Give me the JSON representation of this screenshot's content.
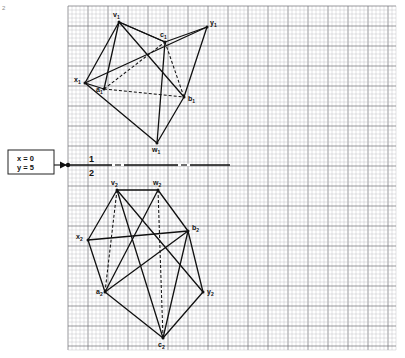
{
  "page": {
    "corner_mark": "2",
    "background_color": "#ffffff",
    "grid": {
      "minor_color": "#b9b9bc",
      "major_color": "#6e6e74",
      "minor_step": 4.0,
      "major_every": 5,
      "x0": 68,
      "y0": 6,
      "x1": 396,
      "y1": 350
    }
  },
  "callout": {
    "line1": "x = 0",
    "line2": "y = 5",
    "box": {
      "x": 8,
      "y": 150,
      "w": 46,
      "h": 24
    },
    "arrow_from_x": 54,
    "arrow_to_x": 68,
    "arrow_y": 165,
    "border_color": "#222222",
    "fill_color": "#ffffff"
  },
  "axis": {
    "label_top": "1",
    "label_bottom": "2",
    "y": 165,
    "x_start": 68,
    "x_end": 230,
    "color": "#111111",
    "dot_x": 68,
    "dash_segments": [
      {
        "x": 112,
        "w": 12
      },
      {
        "x": 178,
        "w": 12
      }
    ]
  },
  "figures": {
    "top": {
      "name": "view-1",
      "vertices": {
        "v1": {
          "x": 119,
          "y": 22,
          "label": "v",
          "sub": "1",
          "lx": 113,
          "ly": 17
        },
        "y1": {
          "x": 207,
          "y": 27,
          "label": "y",
          "sub": "1",
          "lx": 210,
          "ly": 25
        },
        "c1": {
          "x": 165,
          "y": 42,
          "label": "c",
          "sub": "1",
          "lx": 160,
          "ly": 37
        },
        "x1": {
          "x": 85,
          "y": 83,
          "label": "x",
          "sub": "1",
          "lx": 74,
          "ly": 82
        },
        "a1": {
          "x": 104,
          "y": 89,
          "label": "a",
          "sub": "1",
          "lx": 96,
          "ly": 92
        },
        "b1": {
          "x": 184,
          "y": 97,
          "label": "b",
          "sub": "1",
          "lx": 188,
          "ly": 101
        },
        "w1": {
          "x": 157,
          "y": 143,
          "label": "w",
          "sub": "1",
          "lx": 152,
          "ly": 152
        }
      },
      "solid_edges": [
        [
          "v1",
          "x1"
        ],
        [
          "x1",
          "w1"
        ],
        [
          "w1",
          "b1"
        ],
        [
          "b1",
          "y1"
        ],
        [
          "y1",
          "c1"
        ],
        [
          "c1",
          "v1"
        ],
        [
          "v1",
          "b1"
        ],
        [
          "v1",
          "c1"
        ],
        [
          "x1",
          "y1"
        ],
        [
          "c1",
          "w1"
        ],
        [
          "a1",
          "v1"
        ],
        [
          "a1",
          "x1"
        ]
      ],
      "dashed_edges": [
        [
          "a1",
          "c1"
        ],
        [
          "a1",
          "b1"
        ],
        [
          "c1",
          "b1"
        ]
      ]
    },
    "bottom": {
      "name": "view-2",
      "vertices": {
        "v2": {
          "x": 117,
          "y": 190,
          "label": "v",
          "sub": "2",
          "lx": 111,
          "ly": 185
        },
        "w2": {
          "x": 158,
          "y": 190,
          "label": "w",
          "sub": "2",
          "lx": 153,
          "ly": 185
        },
        "b2": {
          "x": 188,
          "y": 231,
          "label": "b",
          "sub": "2",
          "lx": 192,
          "ly": 230
        },
        "x2": {
          "x": 88,
          "y": 240,
          "label": "x",
          "sub": "2",
          "lx": 76,
          "ly": 239
        },
        "a2": {
          "x": 105,
          "y": 292,
          "label": "a",
          "sub": "2",
          "lx": 96,
          "ly": 294
        },
        "y2": {
          "x": 203,
          "y": 292,
          "label": "y",
          "sub": "2",
          "lx": 207,
          "ly": 294
        },
        "c2": {
          "x": 163,
          "y": 338,
          "label": "c",
          "sub": "2",
          "lx": 158,
          "ly": 347
        }
      },
      "solid_edges": [
        [
          "v2",
          "x2"
        ],
        [
          "x2",
          "a2"
        ],
        [
          "a2",
          "c2"
        ],
        [
          "c2",
          "y2"
        ],
        [
          "y2",
          "b2"
        ],
        [
          "b2",
          "w2"
        ],
        [
          "w2",
          "v2"
        ],
        [
          "v2",
          "y2"
        ],
        [
          "x2",
          "b2"
        ],
        [
          "a2",
          "b2"
        ],
        [
          "w2",
          "a2"
        ],
        [
          "v2",
          "c2"
        ],
        [
          "b2",
          "c2"
        ]
      ],
      "dashed_edges": [
        [
          "v2",
          "a2"
        ],
        [
          "w2",
          "c2"
        ]
      ]
    }
  },
  "style": {
    "line_color": "#111111",
    "line_width": 1.3,
    "dash_pattern": "3,2"
  }
}
